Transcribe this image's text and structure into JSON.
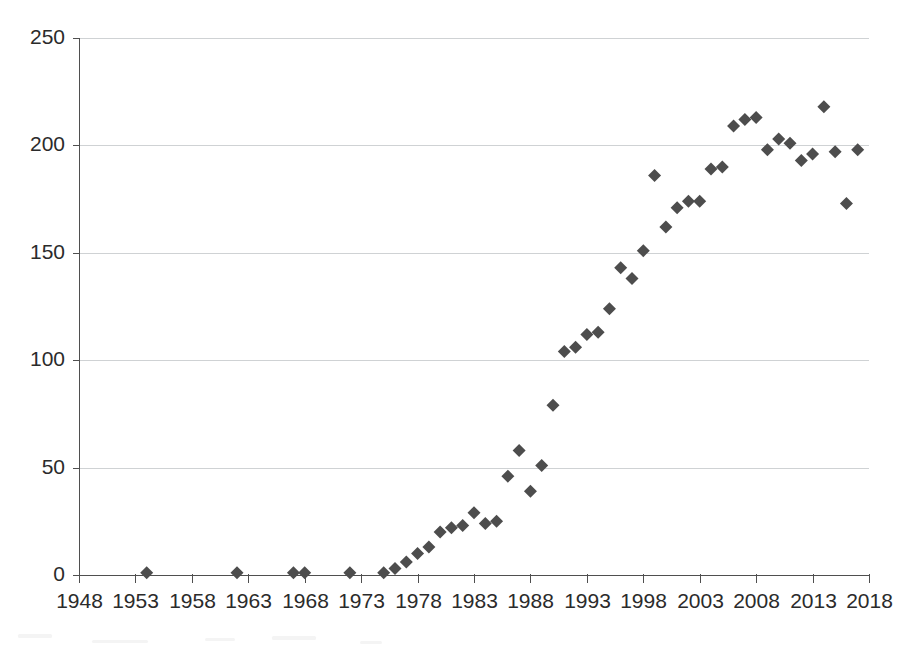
{
  "chart_data": {
    "type": "scatter",
    "title": "",
    "subtitle": "",
    "xlabel": "",
    "ylabel": "",
    "xlim": [
      1948,
      2018
    ],
    "ylim": [
      0,
      250
    ],
    "grid": true,
    "grid_axis": "y",
    "legend": false,
    "legend_position": "none",
    "marker": "diamond",
    "marker_color": "#4d4d4d",
    "marker_size": 13,
    "xticks": [
      1948,
      1953,
      1958,
      1963,
      1968,
      1973,
      1978,
      1983,
      1988,
      1993,
      1998,
      2003,
      2008,
      2013,
      2018
    ],
    "xtick_labels": [
      "1948",
      "1953",
      "1958",
      "1963",
      "1968",
      "1973",
      "1978",
      "1983",
      "1988",
      "1993",
      "1998",
      "2003",
      "2008",
      "2013",
      "2018"
    ],
    "yticks": [
      0,
      50,
      100,
      150,
      200,
      250
    ],
    "ytick_labels": [
      "0",
      "50",
      "100",
      "150",
      "200",
      "250"
    ],
    "x": [
      1954,
      1962,
      1967,
      1968,
      1972,
      1975,
      1976,
      1977,
      1978,
      1979,
      1980,
      1981,
      1982,
      1983,
      1984,
      1985,
      1986,
      1987,
      1988,
      1989,
      1990,
      1991,
      1992,
      1993,
      1994,
      1995,
      1996,
      1997,
      1998,
      1999,
      2000,
      2001,
      2002,
      2003,
      2004,
      2005,
      2006,
      2007,
      2008,
      2009,
      2010,
      2011,
      2012,
      2013,
      2014,
      2015,
      2016,
      2017
    ],
    "y": [
      1,
      1,
      1,
      1,
      1,
      1,
      3,
      6,
      10,
      13,
      20,
      22,
      23,
      29,
      24,
      25,
      46,
      58,
      39,
      51,
      79,
      104,
      106,
      112,
      113,
      124,
      143,
      138,
      151,
      186,
      162,
      171,
      174,
      174,
      189,
      190,
      209,
      212,
      213,
      198,
      203,
      201,
      193,
      196,
      218,
      197,
      173,
      198
    ],
    "series": [
      {
        "name": "series-1",
        "points": [
          [
            1954,
            1
          ],
          [
            1962,
            1
          ],
          [
            1967,
            1
          ],
          [
            1968,
            1
          ],
          [
            1972,
            1
          ],
          [
            1975,
            1
          ],
          [
            1976,
            3
          ],
          [
            1977,
            6
          ],
          [
            1978,
            10
          ],
          [
            1979,
            13
          ],
          [
            1980,
            20
          ],
          [
            1981,
            22
          ],
          [
            1982,
            23
          ],
          [
            1983,
            29
          ],
          [
            1984,
            24
          ],
          [
            1985,
            25
          ],
          [
            1986,
            46
          ],
          [
            1987,
            58
          ],
          [
            1988,
            39
          ],
          [
            1989,
            51
          ],
          [
            1990,
            79
          ],
          [
            1991,
            104
          ],
          [
            1992,
            106
          ],
          [
            1993,
            112
          ],
          [
            1994,
            113
          ],
          [
            1995,
            124
          ],
          [
            1996,
            143
          ],
          [
            1997,
            138
          ],
          [
            1998,
            151
          ],
          [
            1999,
            186
          ],
          [
            2000,
            162
          ],
          [
            2001,
            171
          ],
          [
            2002,
            174
          ],
          [
            2003,
            174
          ],
          [
            2004,
            189
          ],
          [
            2005,
            190
          ],
          [
            2006,
            209
          ],
          [
            2007,
            212
          ],
          [
            2008,
            213
          ],
          [
            2009,
            198
          ],
          [
            2010,
            203
          ],
          [
            2011,
            201
          ],
          [
            2012,
            193
          ],
          [
            2013,
            196
          ],
          [
            2014,
            218
          ],
          [
            2015,
            197
          ],
          [
            2016,
            173
          ],
          [
            2017,
            198
          ]
        ]
      }
    ]
  }
}
